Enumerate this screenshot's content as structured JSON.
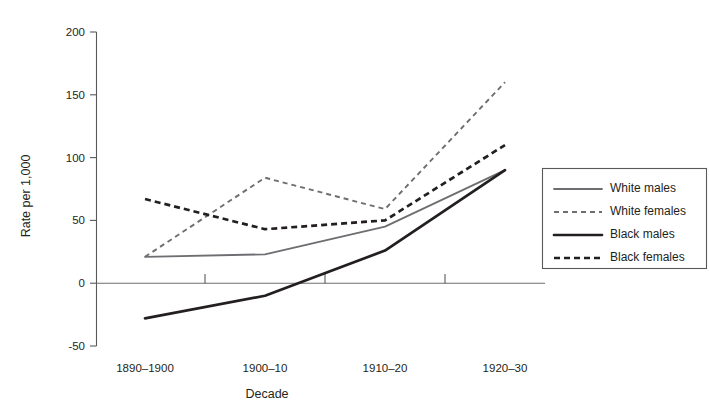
{
  "chart_data": {
    "type": "line",
    "title": "",
    "xlabel": "Decade",
    "ylabel": "Rate per 1,000",
    "categories": [
      "1890–1900",
      "1900–10",
      "1910–20",
      "1920–30"
    ],
    "ylim": [
      -50,
      200
    ],
    "yticks": [
      -50,
      0,
      50,
      100,
      150,
      200
    ],
    "ytick_labels": [
      "-50",
      "0",
      "50",
      "100",
      "150",
      "200"
    ],
    "grid": false,
    "legend_position": "right",
    "series": [
      {
        "name": "White males",
        "style": "solid-thin-gray",
        "color": "#6d6e71",
        "values": [
          21,
          23,
          45,
          90
        ]
      },
      {
        "name": "White females",
        "style": "dashed-thin-gray",
        "color": "#6d6e71",
        "values": [
          21,
          84,
          59,
          160
        ]
      },
      {
        "name": "Black males",
        "style": "solid-thick-black",
        "color": "#231f20",
        "values": [
          -28,
          -10,
          26,
          90
        ]
      },
      {
        "name": "Black females",
        "style": "dashed-thick-black",
        "color": "#231f20",
        "values": [
          67,
          43,
          50,
          110
        ]
      }
    ]
  },
  "axes": {
    "y_title": "Rate per 1,000",
    "x_title": "Decade",
    "y_tick_labels": [
      "200",
      "150",
      "100",
      "50",
      "0",
      "-50"
    ],
    "x_tick_labels": [
      "1890–1900",
      "1900–10",
      "1910–20",
      "1920–30"
    ]
  },
  "legend": {
    "entries": [
      {
        "label": "White males"
      },
      {
        "label": "White females"
      },
      {
        "label": "Black males"
      },
      {
        "label": "Black females"
      }
    ]
  }
}
